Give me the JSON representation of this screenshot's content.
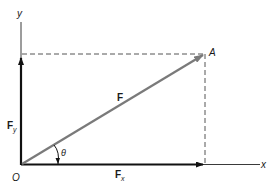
{
  "diagram": {
    "type": "vector-decomposition",
    "axes": {
      "x_label": "x",
      "y_label": "y",
      "origin_label": "O"
    },
    "vector": {
      "label": "F",
      "endpoint_label": "A",
      "color": "#7a7a7a"
    },
    "components": {
      "x_label": "F",
      "x_subscript": "x",
      "y_label": "F",
      "y_subscript": "y",
      "color": "#111111"
    },
    "angle": {
      "label": "θ"
    },
    "colors": {
      "axis": "#3a3a3a",
      "dashed": "#555555",
      "background": "#ffffff"
    }
  }
}
